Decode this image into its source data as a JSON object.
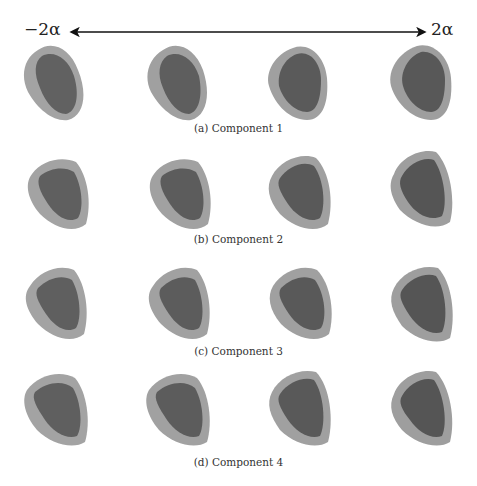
{
  "axis": {
    "left_label": "−2α",
    "right_label": "2α",
    "arrow": "double-headed"
  },
  "figure": {
    "columns": 4,
    "rows": [
      {
        "caption": "(a) Component 1",
        "shapes": [
          "heart-mesh-1",
          "heart-mesh-2",
          "heart-mesh-3",
          "heart-mesh-4"
        ]
      },
      {
        "caption": "(b) Component 2",
        "shapes": [
          "heart-mesh-1",
          "heart-mesh-2",
          "heart-mesh-3",
          "heart-mesh-4"
        ]
      },
      {
        "caption": "(c) Component 3",
        "shapes": [
          "heart-mesh-1",
          "heart-mesh-2",
          "heart-mesh-3",
          "heart-mesh-4"
        ]
      },
      {
        "caption": "(d) Component 4",
        "shapes": [
          "heart-mesh-1",
          "heart-mesh-2",
          "heart-mesh-3",
          "heart-mesh-4"
        ]
      }
    ]
  },
  "colors": {
    "background": "#ffffff",
    "shape_outer": "#9a9a9a",
    "shape_inner": "#5c5c5c",
    "arrow": "#111111"
  }
}
